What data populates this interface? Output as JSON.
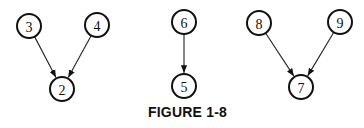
{
  "caption": "FIGURE 1-8",
  "nodes": [
    {
      "id": "3",
      "label": "3",
      "x": 29,
      "y": 26
    },
    {
      "id": "4",
      "label": "4",
      "x": 97,
      "y": 25
    },
    {
      "id": "2",
      "label": "2",
      "x": 62,
      "y": 89
    },
    {
      "id": "6",
      "label": "6",
      "x": 184,
      "y": 22
    },
    {
      "id": "5",
      "label": "5",
      "x": 184,
      "y": 86
    },
    {
      "id": "8",
      "label": "8",
      "x": 259,
      "y": 23
    },
    {
      "id": "9",
      "label": "9",
      "x": 340,
      "y": 22
    },
    {
      "id": "7",
      "label": "7",
      "x": 301,
      "y": 87
    }
  ],
  "edges": [
    {
      "from": "3",
      "to": "2"
    },
    {
      "from": "4",
      "to": "2"
    },
    {
      "from": "6",
      "to": "5"
    },
    {
      "from": "8",
      "to": "7"
    },
    {
      "from": "9",
      "to": "7"
    }
  ],
  "node_radius": 12
}
